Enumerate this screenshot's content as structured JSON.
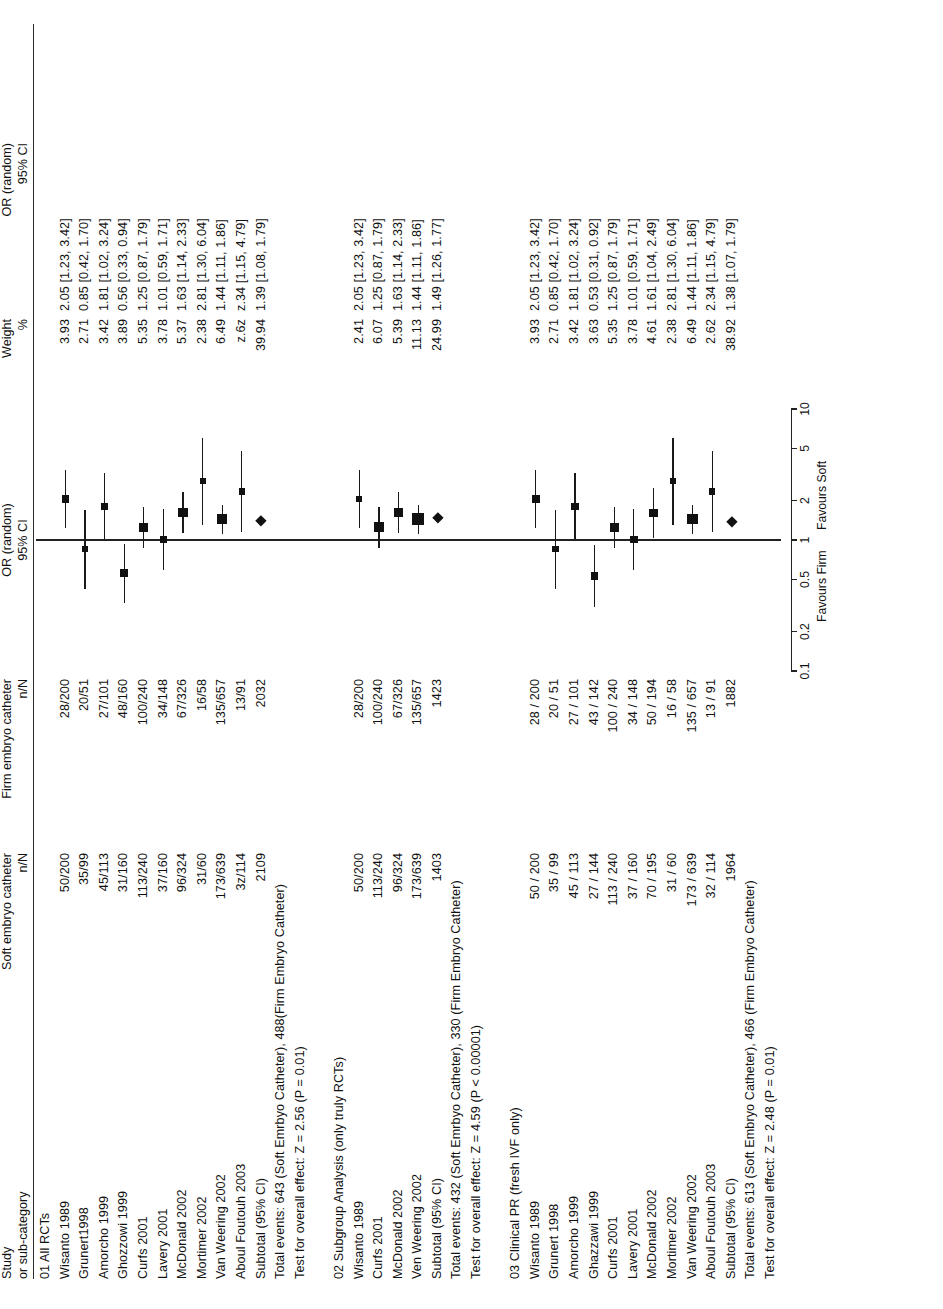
{
  "header": {
    "study_line1": "Study",
    "study_line2": "or sub-category",
    "soft_line1": "Soft embryo catheter",
    "soft_line2": "n/N",
    "firm_line1": "Firm embryo catheter",
    "firm_line2": "n/N",
    "plot_line1": "OR (random)",
    "plot_line2": "95% CI",
    "weight_line1": "Weight",
    "weight_line2": "%",
    "or_line1": "OR (random)",
    "or_line2": "95% CI"
  },
  "axis": {
    "ticks": [
      "0.1",
      "0.2",
      "0.5",
      "1",
      "2",
      "5",
      "10"
    ],
    "tick_values": [
      0.1,
      0.2,
      0.5,
      1,
      2,
      5,
      10
    ],
    "favours_left": "Favours Firm",
    "favours_right": "Favours Soft"
  },
  "groups": [
    {
      "title": "01 All RCTs",
      "rows": [
        {
          "study": "Wisanto 1989",
          "soft": "50/200",
          "firm": "28/200",
          "weight": "3.93",
          "or": "2.05 [1.23, 3.42]",
          "est": 2.05,
          "lo": 1.23,
          "hi": 3.42
        },
        {
          "study": "Grunert1998",
          "soft": "35/99",
          "firm": "20/51",
          "weight": "2.71",
          "or": "0.85 [0.42, 1.70]",
          "est": 0.85,
          "lo": 0.42,
          "hi": 1.7
        },
        {
          "study": "Amorcho 1999",
          "soft": "45/113",
          "firm": "27/101",
          "weight": "3.42",
          "or": "1.81 [1.02, 3.24]",
          "est": 1.81,
          "lo": 1.02,
          "hi": 3.24
        },
        {
          "study": "Ghozzowi 1999",
          "soft": "31/160",
          "firm": "48/160",
          "weight": "3.89",
          "or": "0.56 [0.33, 0.94]",
          "est": 0.56,
          "lo": 0.33,
          "hi": 0.94
        },
        {
          "study": "Curfs 2001",
          "soft": "113/240",
          "firm": "100/240",
          "weight": "5.35",
          "or": "1.25 [0.87, 1.79]",
          "est": 1.25,
          "lo": 0.87,
          "hi": 1.79
        },
        {
          "study": "Lavery 2001",
          "soft": "37/160",
          "firm": "34/148",
          "weight": "3.78",
          "or": "1.01 [0.59, 1.71]",
          "est": 1.01,
          "lo": 0.59,
          "hi": 1.71
        },
        {
          "study": "McDonald 2002",
          "soft": "96/324",
          "firm": "67/326",
          "weight": "5.37",
          "or": "1.63 [1.14, 2.33]",
          "est": 1.63,
          "lo": 1.14,
          "hi": 2.33
        },
        {
          "study": "Mortimer 2002",
          "soft": "31/60",
          "firm": "16/58",
          "weight": "2.38",
          "or": "2.81 [1.30, 6.04]",
          "est": 2.81,
          "lo": 1.3,
          "hi": 6.04
        },
        {
          "study": "Van Weering 2002",
          "soft": "173/639",
          "firm": "135/657",
          "weight": "6.49",
          "or": "1.44 [1.11, 1.86]",
          "est": 1.44,
          "lo": 1.11,
          "hi": 1.86
        },
        {
          "study": "Aboul Foutouh 2003",
          "soft": "3z/114",
          "firm": "13/91",
          "weight": "z.6z",
          "or": "z.34 [1.15, 4.79]",
          "est": 2.34,
          "lo": 1.15,
          "hi": 4.79
        }
      ],
      "subtotal": {
        "study": "Subtotal (95% CI)",
        "soft": "2109",
        "firm": "2032",
        "weight": "39.94",
        "or": "1.39 [1.08, 1.79]",
        "est": 1.39,
        "lo": 1.08,
        "hi": 1.79
      },
      "total_events": "Total events: 643 (Soft Emrbyo Catheter), 488(Firm Embryo Catheter)",
      "test_effect": "Test for overall effect: Z = 2.56 (P = 0.01)"
    },
    {
      "title": "02 Subgroup Analysis (only truly RCTs)",
      "rows": [
        {
          "study": "Wisanto 1989",
          "soft": "50/200",
          "firm": "28/200",
          "weight": "2.41",
          "or": "2.05 [1.23, 3.42]",
          "est": 2.05,
          "lo": 1.23,
          "hi": 3.42
        },
        {
          "study": "Curfs 2001",
          "soft": "113/240",
          "firm": "100/240",
          "weight": "6.07",
          "or": "1.25 [0.87, 1.79]",
          "est": 1.25,
          "lo": 0.87,
          "hi": 1.79
        },
        {
          "study": "McDonald 2002",
          "soft": "96/324",
          "firm": "67/326",
          "weight": "5.39",
          "or": "1.63 [1.14, 2.33]",
          "est": 1.63,
          "lo": 1.14,
          "hi": 2.33
        },
        {
          "study": "Ven Weering 2002",
          "soft": "173/639",
          "firm": "135/657",
          "weight": "11.13",
          "or": "1.44 [1.11, 1.86]",
          "est": 1.44,
          "lo": 1.11,
          "hi": 1.86
        }
      ],
      "subtotal": {
        "study": "Subtotal (95% CI)",
        "soft": "1403",
        "firm": "1423",
        "weight": "24.99",
        "or": "1.49 [1.26, 1.77]",
        "est": 1.49,
        "lo": 1.26,
        "hi": 1.77
      },
      "total_events": "Total events: 432 (Soft Emrbyo Catheter), 330 (Firm Embryo Catheter)",
      "test_effect": "Test for overall effect: Z = 4.59 (P < 0.00001)"
    },
    {
      "title": "03 Clinical PR (fresh IVF only)",
      "rows": [
        {
          "study": "Wisanto 1989",
          "soft": "50 / 200",
          "firm": "28 / 200",
          "weight": "3.93",
          "or": "2.05 [1.23, 3.42]",
          "est": 2.05,
          "lo": 1.23,
          "hi": 3.42
        },
        {
          "study": "Grunert 1998",
          "soft": "35 / 99",
          "firm": "20 / 51",
          "weight": "2.71",
          "or": "0.85 [0.42, 1.70]",
          "est": 0.85,
          "lo": 0.42,
          "hi": 1.7
        },
        {
          "study": "Amorcho 1999",
          "soft": "45 / 113",
          "firm": "27 / 101",
          "weight": "3.42",
          "or": "1.81 [1.02, 3.24]",
          "est": 1.81,
          "lo": 1.02,
          "hi": 3.24
        },
        {
          "study": "Ghazzawi 1999",
          "soft": "27 / 144",
          "firm": "43 / 142",
          "weight": "3.63",
          "or": "0.53 [0.31, 0.92]",
          "est": 0.53,
          "lo": 0.31,
          "hi": 0.92
        },
        {
          "study": "Curfs 2001",
          "soft": "113 / 240",
          "firm": "100 / 240",
          "weight": "5.35",
          "or": "1.25 [0.87, 1.79]",
          "est": 1.25,
          "lo": 0.87,
          "hi": 1.79
        },
        {
          "study": "Lavery 2001",
          "soft": "37 / 160",
          "firm": "34 / 148",
          "weight": "3.78",
          "or": "1.01 [0.59, 1.71]",
          "est": 1.01,
          "lo": 0.59,
          "hi": 1.71
        },
        {
          "study": "McDonald 2002",
          "soft": "70 / 195",
          "firm": "50 / 194",
          "weight": "4.61",
          "or": "1.61 [1.04, 2.49]",
          "est": 1.61,
          "lo": 1.04,
          "hi": 2.49
        },
        {
          "study": "Mortimer 2002",
          "soft": "31 / 60",
          "firm": "16 / 58",
          "weight": "2.38",
          "or": "2.81 [1.30, 6.04]",
          "est": 2.81,
          "lo": 1.3,
          "hi": 6.04
        },
        {
          "study": "Van Weering 2002",
          "soft": "173 / 639",
          "firm": "135 / 657",
          "weight": "6.49",
          "or": "1.44 [1.11, 1.86]",
          "est": 1.44,
          "lo": 1.11,
          "hi": 1.86
        },
        {
          "study": "Aboul Foutouh 2003",
          "soft": "32 / 114",
          "firm": "13 / 91",
          "weight": "2.62",
          "or": "2.34 [1.15, 4.79]",
          "est": 2.34,
          "lo": 1.15,
          "hi": 4.79
        }
      ],
      "subtotal": {
        "study": "Subtotal (95% CI)",
        "soft": "1964",
        "firm": "1882",
        "weight": "38.92",
        "or": "1.38 [1.07, 1.79]",
        "est": 1.38,
        "lo": 1.07,
        "hi": 1.79
      },
      "total_events": "Total events: 613 (Soft Embryo Catheter), 466 (Firm Embryo Catheter)",
      "test_effect": "Test for overall effect: Z = 2.48 (P = 0.01)"
    }
  ],
  "chart_data": {
    "type": "forest",
    "title": "OR (random) 95% CI",
    "xlabel": "Odds Ratio (log scale)",
    "xlim": [
      0.1,
      10
    ],
    "xticks": [
      0.1,
      0.2,
      0.5,
      1,
      2,
      5,
      10
    ],
    "reference_line": 1,
    "favours_left": "Favours Firm",
    "favours_right": "Favours Soft",
    "series": [
      {
        "name": "01 All RCTs",
        "points": [
          {
            "label": "Wisanto 1989",
            "est": 2.05,
            "lo": 1.23,
            "hi": 3.42,
            "weight": 3.93
          },
          {
            "label": "Grunert1998",
            "est": 0.85,
            "lo": 0.42,
            "hi": 1.7,
            "weight": 2.71
          },
          {
            "label": "Amorcho 1999",
            "est": 1.81,
            "lo": 1.02,
            "hi": 3.24,
            "weight": 3.42
          },
          {
            "label": "Ghozzowi 1999",
            "est": 0.56,
            "lo": 0.33,
            "hi": 0.94,
            "weight": 3.89
          },
          {
            "label": "Curfs 2001",
            "est": 1.25,
            "lo": 0.87,
            "hi": 1.79,
            "weight": 5.35
          },
          {
            "label": "Lavery 2001",
            "est": 1.01,
            "lo": 0.59,
            "hi": 1.71,
            "weight": 3.78
          },
          {
            "label": "McDonald 2002",
            "est": 1.63,
            "lo": 1.14,
            "hi": 2.33,
            "weight": 5.37
          },
          {
            "label": "Mortimer 2002",
            "est": 2.81,
            "lo": 1.3,
            "hi": 6.04,
            "weight": 2.38
          },
          {
            "label": "Van Weering 2002",
            "est": 1.44,
            "lo": 1.11,
            "hi": 1.86,
            "weight": 6.49
          },
          {
            "label": "Aboul Foutouh 2003",
            "est": 2.34,
            "lo": 1.15,
            "hi": 4.79,
            "weight": 2.62
          },
          {
            "label": "Subtotal (95% CI)",
            "est": 1.39,
            "lo": 1.08,
            "hi": 1.79,
            "weight": 39.94,
            "summary": true
          }
        ]
      },
      {
        "name": "02 Subgroup Analysis (only truly RCTs)",
        "points": [
          {
            "label": "Wisanto 1989",
            "est": 2.05,
            "lo": 1.23,
            "hi": 3.42,
            "weight": 2.41
          },
          {
            "label": "Curfs 2001",
            "est": 1.25,
            "lo": 0.87,
            "hi": 1.79,
            "weight": 6.07
          },
          {
            "label": "McDonald 2002",
            "est": 1.63,
            "lo": 1.14,
            "hi": 2.33,
            "weight": 5.39
          },
          {
            "label": "Ven Weering 2002",
            "est": 1.44,
            "lo": 1.11,
            "hi": 1.86,
            "weight": 11.13
          },
          {
            "label": "Subtotal (95% CI)",
            "est": 1.49,
            "lo": 1.26,
            "hi": 1.77,
            "weight": 24.99,
            "summary": true
          }
        ]
      },
      {
        "name": "03 Clinical PR (fresh IVF only)",
        "points": [
          {
            "label": "Wisanto 1989",
            "est": 2.05,
            "lo": 1.23,
            "hi": 3.42,
            "weight": 3.93
          },
          {
            "label": "Grunert 1998",
            "est": 0.85,
            "lo": 0.42,
            "hi": 1.7,
            "weight": 2.71
          },
          {
            "label": "Amorcho 1999",
            "est": 1.81,
            "lo": 1.02,
            "hi": 3.24,
            "weight": 3.42
          },
          {
            "label": "Ghazzawi 1999",
            "est": 0.53,
            "lo": 0.31,
            "hi": 0.92,
            "weight": 3.63
          },
          {
            "label": "Curfs 2001",
            "est": 1.25,
            "lo": 0.87,
            "hi": 1.79,
            "weight": 5.35
          },
          {
            "label": "Lavery 2001",
            "est": 1.01,
            "lo": 0.59,
            "hi": 1.71,
            "weight": 3.78
          },
          {
            "label": "McDonald 2002",
            "est": 1.61,
            "lo": 1.04,
            "hi": 2.49,
            "weight": 4.61
          },
          {
            "label": "Mortimer 2002",
            "est": 2.81,
            "lo": 1.3,
            "hi": 6.04,
            "weight": 2.38
          },
          {
            "label": "Van Weering 2002",
            "est": 1.44,
            "lo": 1.11,
            "hi": 1.86,
            "weight": 6.49
          },
          {
            "label": "Aboul Foutouh 2003",
            "est": 2.34,
            "lo": 1.15,
            "hi": 4.79,
            "weight": 2.62
          },
          {
            "label": "Subtotal (95% CI)",
            "est": 1.38,
            "lo": 1.07,
            "hi": 1.79,
            "weight": 38.92,
            "summary": true
          }
        ]
      }
    ]
  }
}
